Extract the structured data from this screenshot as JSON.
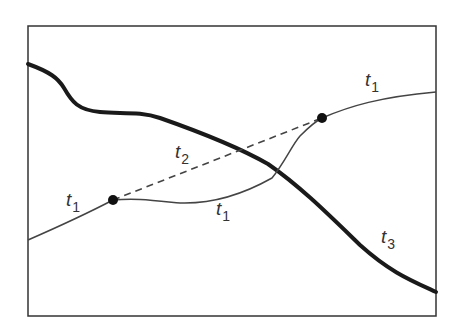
{
  "diagram": {
    "colors": {
      "frame": "#333333",
      "thin_curve": "#444444",
      "thick_curve": "#1a1a1a",
      "dashed": "#444444",
      "points": "#111111",
      "background": "#ffffff"
    },
    "labels": {
      "t1_left": {
        "base": "t",
        "sub": "1"
      },
      "t1_mid": {
        "base": "t",
        "sub": "1"
      },
      "t1_right": {
        "base": "t",
        "sub": "1"
      },
      "t2": {
        "base": "t",
        "sub": "2"
      },
      "t3": {
        "base": "t",
        "sub": "3"
      }
    },
    "points": [
      {
        "name": "left-point",
        "x": 113,
        "y": 200
      },
      {
        "name": "right-point",
        "x": 322,
        "y": 118
      }
    ]
  }
}
